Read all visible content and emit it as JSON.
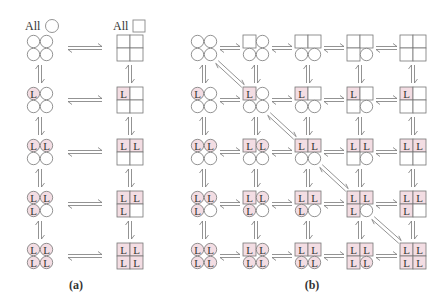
{
  "colors": {
    "stroke": "#777777",
    "fill_bound": "#f3dde3",
    "fill_empty": "#ffffff",
    "text": "#333333"
  },
  "legend": {
    "circle_label": "All",
    "square_label": "All"
  },
  "ligand_letter": "L",
  "panel_a": {
    "label": "(a)",
    "description": "Concerted (MWC) model: all-circle (T) and all-square (R) states, 0–4 ligands bound",
    "rows": [
      {
        "circle": [
          "",
          "",
          "",
          ""
        ],
        "square": [
          "",
          "",
          "",
          ""
        ]
      },
      {
        "circle": [
          "L",
          "",
          "",
          ""
        ],
        "square": [
          "L",
          "",
          "",
          ""
        ]
      },
      {
        "circle": [
          "L",
          "L",
          "",
          ""
        ],
        "square": [
          "L",
          "L",
          "",
          ""
        ]
      },
      {
        "circle": [
          "L",
          "L",
          "L",
          ""
        ],
        "square": [
          "L",
          "L",
          "L",
          ""
        ]
      },
      {
        "circle": [
          "L",
          "L",
          "L",
          "L"
        ],
        "square": [
          "L",
          "L",
          "L",
          "L"
        ]
      }
    ]
  },
  "panel_b": {
    "label": "(b)",
    "description": "General model: columns = number of subunits in square conformation (0–4), rows = number of ligands bound (0–4)",
    "grid": [
      [
        {
          "shapes": [
            "c",
            "c",
            "c",
            "c"
          ],
          "lig": [
            "",
            "",
            "",
            ""
          ]
        },
        {
          "shapes": [
            "s",
            "c",
            "c",
            "c"
          ],
          "lig": [
            "",
            "",
            "",
            ""
          ]
        },
        {
          "shapes": [
            "s",
            "s",
            "c",
            "c"
          ],
          "lig": [
            "",
            "",
            "",
            ""
          ]
        },
        {
          "shapes": [
            "s",
            "s",
            "s",
            "c"
          ],
          "lig": [
            "",
            "",
            "",
            ""
          ]
        },
        {
          "shapes": [
            "s",
            "s",
            "s",
            "s"
          ],
          "lig": [
            "",
            "",
            "",
            ""
          ]
        }
      ],
      [
        {
          "shapes": [
            "c",
            "c",
            "c",
            "c"
          ],
          "lig": [
            "L",
            "",
            "",
            ""
          ]
        },
        {
          "shapes": [
            "s",
            "c",
            "c",
            "c"
          ],
          "lig": [
            "L",
            "",
            "",
            ""
          ]
        },
        {
          "shapes": [
            "s",
            "s",
            "c",
            "c"
          ],
          "lig": [
            "L",
            "",
            "",
            ""
          ]
        },
        {
          "shapes": [
            "s",
            "s",
            "s",
            "c"
          ],
          "lig": [
            "L",
            "",
            "",
            ""
          ]
        },
        {
          "shapes": [
            "s",
            "s",
            "s",
            "s"
          ],
          "lig": [
            "L",
            "",
            "",
            ""
          ]
        }
      ],
      [
        {
          "shapes": [
            "c",
            "c",
            "c",
            "c"
          ],
          "lig": [
            "L",
            "L",
            "",
            ""
          ]
        },
        {
          "shapes": [
            "s",
            "c",
            "c",
            "c"
          ],
          "lig": [
            "L",
            "L",
            "",
            ""
          ]
        },
        {
          "shapes": [
            "s",
            "s",
            "c",
            "c"
          ],
          "lig": [
            "L",
            "L",
            "",
            ""
          ]
        },
        {
          "shapes": [
            "s",
            "s",
            "s",
            "c"
          ],
          "lig": [
            "L",
            "L",
            "",
            ""
          ]
        },
        {
          "shapes": [
            "s",
            "s",
            "s",
            "s"
          ],
          "lig": [
            "L",
            "L",
            "",
            ""
          ]
        }
      ],
      [
        {
          "shapes": [
            "c",
            "c",
            "c",
            "c"
          ],
          "lig": [
            "L",
            "L",
            "L",
            ""
          ]
        },
        {
          "shapes": [
            "s",
            "c",
            "c",
            "c"
          ],
          "lig": [
            "L",
            "L",
            "L",
            ""
          ]
        },
        {
          "shapes": [
            "s",
            "s",
            "c",
            "c"
          ],
          "lig": [
            "L",
            "L",
            "L",
            ""
          ]
        },
        {
          "shapes": [
            "s",
            "s",
            "s",
            "c"
          ],
          "lig": [
            "L",
            "L",
            "L",
            ""
          ]
        },
        {
          "shapes": [
            "s",
            "s",
            "s",
            "s"
          ],
          "lig": [
            "L",
            "L",
            "L",
            ""
          ]
        }
      ],
      [
        {
          "shapes": [
            "c",
            "c",
            "c",
            "c"
          ],
          "lig": [
            "L",
            "L",
            "L",
            "L"
          ]
        },
        {
          "shapes": [
            "s",
            "c",
            "c",
            "c"
          ],
          "lig": [
            "L",
            "L",
            "L",
            "L"
          ]
        },
        {
          "shapes": [
            "s",
            "s",
            "c",
            "c"
          ],
          "lig": [
            "L",
            "L",
            "L",
            "L"
          ]
        },
        {
          "shapes": [
            "s",
            "s",
            "s",
            "c"
          ],
          "lig": [
            "L",
            "L",
            "L",
            "L"
          ]
        },
        {
          "shapes": [
            "s",
            "s",
            "s",
            "s"
          ],
          "lig": [
            "L",
            "L",
            "L",
            "L"
          ]
        }
      ]
    ],
    "diagonals": [
      [
        0,
        0,
        1,
        1
      ],
      [
        1,
        1,
        2,
        2
      ],
      [
        2,
        2,
        3,
        3
      ],
      [
        3,
        3,
        4,
        4
      ]
    ]
  },
  "layout": {
    "row_y": [
      48,
      100,
      152,
      204,
      256
    ],
    "a_circle_x": 40,
    "a_square_x": 130,
    "b_col_x": [
      204,
      256,
      308,
      360,
      413
    ],
    "label_y": 289
  }
}
